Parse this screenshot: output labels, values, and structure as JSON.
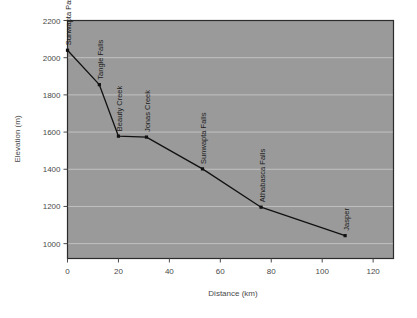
{
  "chart_data": {
    "type": "line",
    "title": "",
    "xlabel": "Distance (km)",
    "ylabel": "Elevation (m)",
    "xlim": [
      0,
      128
    ],
    "ylim": [
      920,
      2200
    ],
    "xticks": [
      "0",
      "20",
      "40",
      "60",
      "80",
      "100",
      "120"
    ],
    "xtick_values": [
      0,
      20,
      40,
      60,
      80,
      100,
      120
    ],
    "yticks": [
      "1000",
      "1200",
      "1400",
      "1600",
      "1800",
      "2000",
      "2200"
    ],
    "ytick_values": [
      1000,
      1200,
      1400,
      1600,
      1800,
      2000,
      2200
    ],
    "grid": "horizontal",
    "legend": "none",
    "plot_background": "#9a9a9a",
    "line_color": "#111111",
    "marker_color": "#111111",
    "gridline_color": "#cfcfcf",
    "points": [
      {
        "label": "Sunwapta Pass",
        "x": 0,
        "y": 2040
      },
      {
        "label": "Tangle Falls",
        "x": 12.5,
        "y": 1855
      },
      {
        "label": "Beauty Creek",
        "x": 20,
        "y": 1578
      },
      {
        "label": "Jonas Creek",
        "x": 31,
        "y": 1573
      },
      {
        "label": "Sunwapta Falls",
        "x": 53,
        "y": 1402
      },
      {
        "label": "Athabasca Falls",
        "x": 76,
        "y": 1196
      },
      {
        "label": "Jasper",
        "x": 109,
        "y": 1043
      }
    ]
  }
}
